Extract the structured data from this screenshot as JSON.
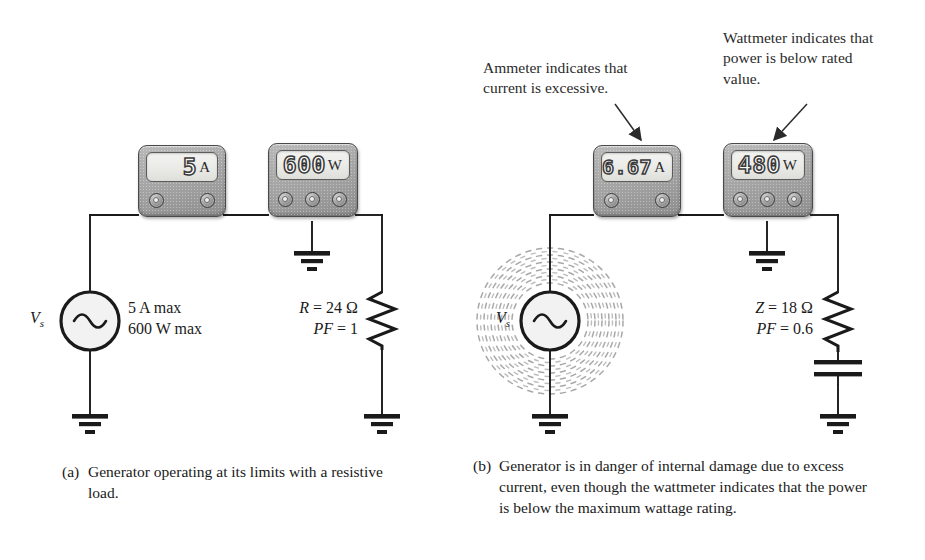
{
  "figure": {
    "type": "circuit-diagram"
  },
  "panel_a": {
    "ammeter": {
      "name": "ammeter",
      "value": "5",
      "unit": "A"
    },
    "wattmeter": {
      "name": "wattmeter",
      "value": "600",
      "unit": "W"
    },
    "source": {
      "symbol": "Vs",
      "sub": "s",
      "rating_line1": "5 A max",
      "rating_line2": "600 W max"
    },
    "load": {
      "line1_name": "R",
      "line1_value": "= 24 Ω",
      "line2_name": "PF",
      "line2_value": "= 1",
      "element": "resistor"
    },
    "caption": {
      "label": "(a)",
      "text": "Generator operating at its limits with a resistive load."
    }
  },
  "panel_b": {
    "annotation_left": "Ammeter indicates that current is excessive.",
    "annotation_right": "Wattmeter indicates that power is below rated value.",
    "ammeter": {
      "name": "ammeter",
      "value": "6.67",
      "unit": "A"
    },
    "wattmeter": {
      "name": "wattmeter",
      "value": "480",
      "unit": "W"
    },
    "source": {
      "symbol": "Vs",
      "sub": "s",
      "state": "overheating"
    },
    "load": {
      "line1_name": "Z",
      "line1_value": "= 18 Ω",
      "line2_name": "PF",
      "line2_value": "= 0.6",
      "element": "resistor-capacitor"
    },
    "caption": {
      "label": "(b)",
      "text": "Generator is in danger of internal damage due to excess current, even though the wattmeter indicates that the power is below the maximum wattage rating."
    }
  },
  "colors": {
    "ink": "#1a1a1a",
    "wire": "#1a1a1a",
    "meter_body": "#a9a9a9",
    "screen": "#eeeeea",
    "annotation": "#2b2b2b"
  }
}
